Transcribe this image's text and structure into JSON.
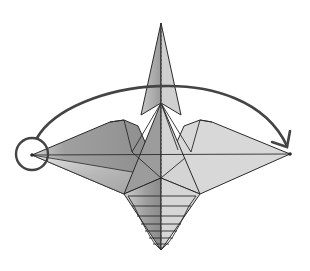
{
  "diagram": {
    "type": "origami-fold-step",
    "instruction_symbols": [
      {
        "kind": "circle-marker",
        "target": "left wing tip",
        "meaning": "point of reference"
      },
      {
        "kind": "curved-arrow",
        "from": "left wing tip",
        "to": "right wing tip",
        "meaning": "fold left point over to the right"
      }
    ],
    "colors": {
      "outline": "#2a2a2a",
      "arrow": "#444444",
      "paper_light": "#d6d6d6",
      "paper_mid": "#a8a8a8",
      "paper_dark": "#8a8a8a",
      "background": "#ffffff"
    }
  }
}
